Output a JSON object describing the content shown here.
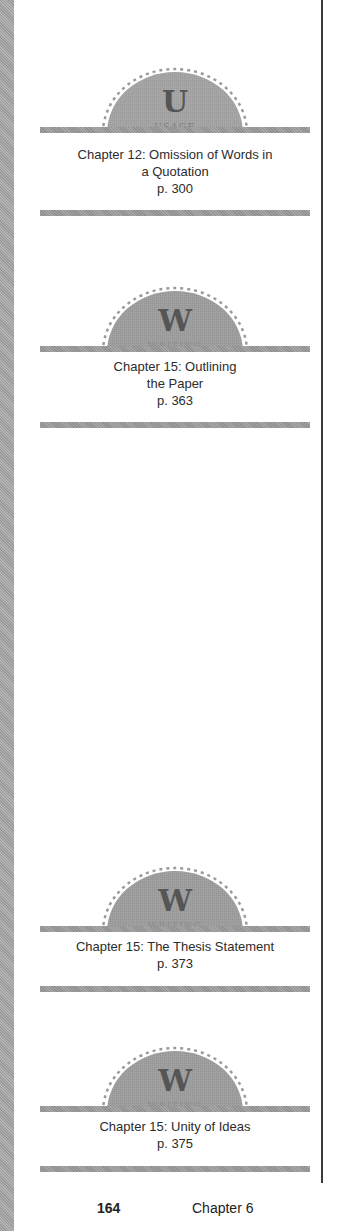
{
  "colors": {
    "badge_fill": "#a3a3a3",
    "bar_fill": "#9c9c9c",
    "rule": "#3a3a3a",
    "text": "#2c2c2c",
    "letter": "#555555"
  },
  "references": [
    {
      "badge_letter": "U",
      "badge_label": "USAGE",
      "badge_icon": "usage-badge-icon",
      "lines": [
        "Chapter 12: Omission of Words in",
        "a Quotation",
        "p. 300"
      ]
    },
    {
      "badge_letter": "W",
      "badge_label": "WRITING",
      "badge_icon": "writing-badge-icon",
      "lines": [
        "Chapter 15: Outlining",
        "the Paper",
        "p. 363"
      ]
    },
    {
      "badge_letter": "W",
      "badge_label": "WRITING",
      "badge_icon": "writing-badge-icon",
      "lines": [
        "Chapter 15: The Thesis Statement",
        "p. 373"
      ]
    },
    {
      "badge_letter": "W",
      "badge_label": "WRITING",
      "badge_icon": "writing-badge-icon",
      "lines": [
        "Chapter 15: Unity of Ideas",
        "p. 375"
      ]
    }
  ],
  "footer": {
    "page_number": "164",
    "chapter": "Chapter 6"
  }
}
